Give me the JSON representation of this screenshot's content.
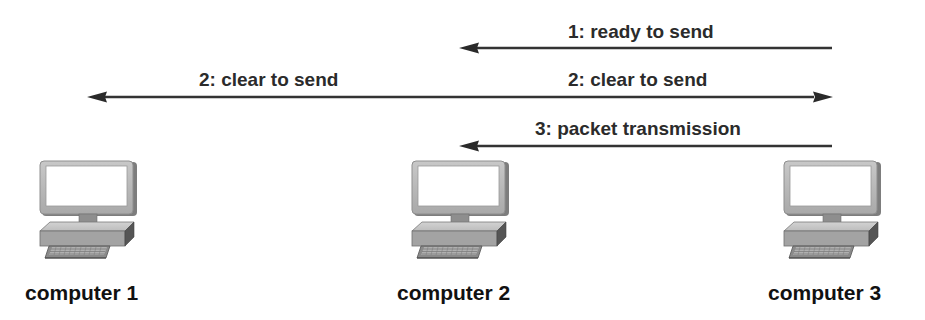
{
  "diagram": {
    "type": "sequence",
    "nodes": [
      {
        "id": "computer-1",
        "label": "computer 1",
        "icon": "desktop-computer-icon"
      },
      {
        "id": "computer-2",
        "label": "computer 2",
        "icon": "desktop-computer-icon"
      },
      {
        "id": "computer-3",
        "label": "computer 3",
        "icon": "desktop-computer-icon"
      }
    ],
    "messages": [
      {
        "step": 1,
        "label": "1: ready to send",
        "from": "computer 3",
        "to": "computer 2"
      },
      {
        "step": 2,
        "label": "2: clear to send",
        "from": "computer 2",
        "to": "computer 1"
      },
      {
        "step": 2,
        "label": "2: clear to send",
        "from": "computer 2",
        "to": "computer 3"
      },
      {
        "step": 3,
        "label": "3: packet transmission",
        "from": "computer 3",
        "to": "computer 2"
      }
    ],
    "colors": {
      "arrow": "#333333",
      "label": "#2b2b2b",
      "node_label": "#111111",
      "monitor_frame": "#b9b9b9",
      "monitor_screen": "#ffffff",
      "base": "#a8a8a8",
      "keyboard": "#8a8a8a"
    }
  }
}
